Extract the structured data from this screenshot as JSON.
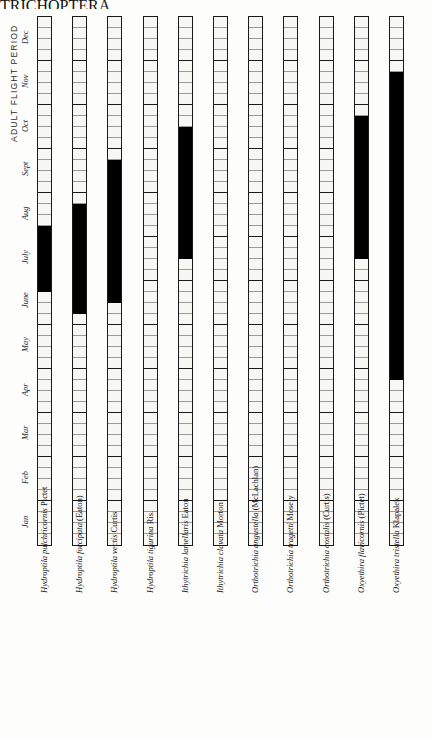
{
  "page": {
    "running_head": "TRICHOPTERA",
    "folio": "171"
  },
  "axis": {
    "title": "ADULT FLIGHT PERIOD",
    "month_labels": [
      "Jan",
      "Feb",
      "Mar",
      "Apr",
      "May",
      "June",
      "July",
      "Aug",
      "Sept",
      "Oct",
      "Nov",
      "Dec"
    ],
    "weeks_per_month": 4,
    "orientation": "months-bottom-to-top"
  },
  "chart_data": {
    "type": "bar",
    "title": "ADULT FLIGHT PERIOD",
    "xlabel": "",
    "ylabel": "ADULT FLIGHT PERIOD",
    "grid": true,
    "legend": "none",
    "categories": [
      "Hydroptila pulchricornis Pictet",
      "Hydroptila forcipata (Eaton)",
      "Hydroptila vectis Curtis",
      "Hydroptila tigurina Ris.",
      "Ithytrichia lamellaris Eaton",
      "Ithytrichia clavata Morton",
      "Orthotrichia angustella (McLachlan)",
      "Orthotrichia tragetti Mosely",
      "Orthotrichia costalis (Curtis)",
      "Oxyethira flavicornis (Pictet)",
      "Oxyethira tristella Klapalek"
    ],
    "y_ticks": [
      "Jan",
      "Feb",
      "Mar",
      "Apr",
      "May",
      "June",
      "July",
      "Aug",
      "Sept",
      "Oct",
      "Nov",
      "Dec"
    ],
    "ylim": [
      0,
      48
    ],
    "series": [
      {
        "name": "Hydroptila pulchricornis Pictet",
        "genus": "Hydroptila",
        "epithet": "pulchricornis",
        "authority": "Pictet",
        "flight_weeks": [
          23,
          28
        ],
        "flight_months": "June - July"
      },
      {
        "name": "Hydroptila forcipata (Eaton)",
        "genus": "Hydroptila",
        "epithet": "forcipata",
        "authority": "(Eaton)",
        "flight_weeks": [
          21,
          30
        ],
        "flight_months": "late May - early Aug"
      },
      {
        "name": "Hydroptila vectis Curtis",
        "genus": "Hydroptila",
        "epithet": "vectis",
        "authority": "Curtis",
        "flight_weeks": [
          22,
          34
        ],
        "flight_months": "June - early Sept"
      },
      {
        "name": "Hydroptila tigurina Ris.",
        "genus": "Hydroptila",
        "epithet": "tigurina",
        "authority": "Ris.",
        "flight_weeks": [],
        "flight_months": ""
      },
      {
        "name": "Ithytrichia lamellaris Eaton",
        "genus": "Ithytrichia",
        "epithet": "lamellaris",
        "authority": "Eaton",
        "flight_weeks": [
          26,
          37
        ],
        "flight_months": "July - Sept"
      },
      {
        "name": "Ithytrichia clavata Morton",
        "genus": "Ithytrichia",
        "epithet": "clavata",
        "authority": "Morton",
        "flight_weeks": [],
        "flight_months": ""
      },
      {
        "name": "Orthotrichia angustella (McLachlan)",
        "genus": "Orthotrichia",
        "epithet": "angustella",
        "authority": "(McLachlan)",
        "flight_weeks": [],
        "flight_months": ""
      },
      {
        "name": "Orthotrichia tragetti Mosely",
        "genus": "Orthotrichia",
        "epithet": "tragetti",
        "authority": "Mosely",
        "flight_weeks": [],
        "flight_months": ""
      },
      {
        "name": "Orthotrichia costalis (Curtis)",
        "genus": "Orthotrichia",
        "epithet": "costalis",
        "authority": "(Curtis)",
        "flight_weeks": [],
        "flight_months": ""
      },
      {
        "name": "Oxyethira flavicornis (Pictet)",
        "genus": "Oxyethira",
        "epithet": "flavicornis",
        "authority": "(Pictet)",
        "flight_weeks": [
          26,
          38
        ],
        "flight_months": "July - Oct"
      },
      {
        "name": "Oxyethira tristella Klapalek",
        "genus": "Oxyethira",
        "epithet": "tristella",
        "authority": "Klapalek",
        "flight_weeks": [
          15,
          42
        ],
        "flight_months": "Apr - Oct"
      }
    ]
  },
  "colors": {
    "flight_fill": "#000000",
    "cell_empty": "#f7f7f4",
    "bar_outline": "#1a1a1a",
    "page_background": "#fdfdfb"
  }
}
